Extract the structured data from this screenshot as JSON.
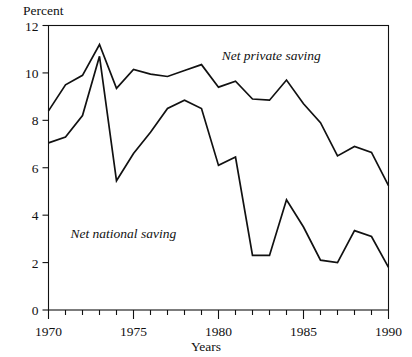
{
  "chart_data": {
    "type": "line",
    "title": "",
    "xlabel": "Years",
    "ylabel": "Percent",
    "xlim": [
      1970,
      1990
    ],
    "ylim": [
      0,
      12
    ],
    "grid": false,
    "legend_position": "inline-annotations",
    "x": [
      1970,
      1971,
      1972,
      1973,
      1974,
      1975,
      1976,
      1977,
      1978,
      1979,
      1980,
      1981,
      1982,
      1983,
      1984,
      1985,
      1986,
      1987,
      1988,
      1989,
      1990
    ],
    "xticks": [
      1970,
      1971,
      1972,
      1973,
      1974,
      1975,
      1976,
      1977,
      1978,
      1979,
      1980,
      1981,
      1982,
      1983,
      1984,
      1985,
      1986,
      1987,
      1988,
      1989,
      1990
    ],
    "xtick_labels": [
      "1970",
      "",
      "",
      "",
      "",
      "1975",
      "",
      "",
      "",
      "",
      "1980",
      "",
      "",
      "",
      "",
      "1985",
      "",
      "",
      "",
      "",
      "1990"
    ],
    "yticks": [
      0,
      2,
      4,
      6,
      8,
      10,
      12
    ],
    "ytick_labels": [
      "0",
      "2",
      "4",
      "6",
      "8",
      "10",
      "12"
    ],
    "series": [
      {
        "name": "Net private saving",
        "label_x": 1983.1,
        "label_y": 10.55,
        "values": [
          8.4,
          9.5,
          9.9,
          11.2,
          9.35,
          10.15,
          9.95,
          9.85,
          10.1,
          10.35,
          9.4,
          9.65,
          8.9,
          8.85,
          9.7,
          8.7,
          7.9,
          6.5,
          6.9,
          6.65,
          5.25
        ]
      },
      {
        "name": "Net national saving",
        "label_x": 1974.4,
        "label_y": 3.05,
        "values": [
          7.05,
          7.3,
          8.2,
          10.7,
          5.45,
          6.6,
          7.5,
          8.5,
          8.85,
          8.5,
          6.1,
          6.45,
          2.3,
          2.3,
          4.65,
          3.5,
          2.1,
          2.0,
          3.35,
          3.1,
          1.8
        ]
      }
    ]
  },
  "axes": {
    "y_title": "Percent",
    "x_title": "Years"
  },
  "colors": {
    "line": "#111111",
    "frame": "#111111",
    "background": "#ffffff"
  }
}
